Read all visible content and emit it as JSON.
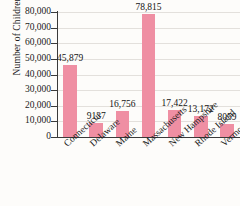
{
  "chart_data": {
    "type": "bar",
    "title": "",
    "xlabel": "",
    "ylabel": "Number of Children",
    "ylim": [
      0,
      80000
    ],
    "yticks": [
      0,
      10000,
      20000,
      30000,
      40000,
      50000,
      60000,
      70000,
      80000
    ],
    "ytick_labels": [
      "0",
      "10,000",
      "20,000",
      "30,000",
      "40,000",
      "50,000",
      "60,000",
      "70,000",
      "80,000"
    ],
    "grid": true,
    "legend": "none",
    "bar_color": "#ef8fa3",
    "categories": [
      "Connecticut",
      "Delaware",
      "Maine",
      "Massachusetts",
      "New Hampshire",
      "Rhode Island",
      "Vermont"
    ],
    "values": [
      45879,
      9137,
      16756,
      78815,
      17422,
      13172,
      8059
    ],
    "value_labels": [
      "45,879",
      "9137",
      "16,756",
      "78,815",
      "17,422",
      "13,172",
      "8059"
    ]
  }
}
